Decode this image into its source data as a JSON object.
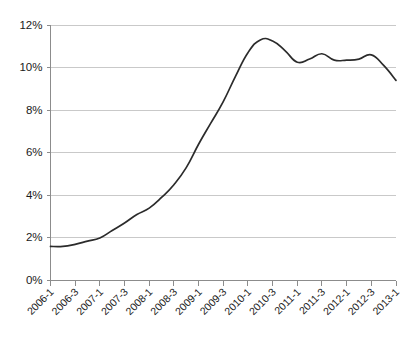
{
  "chart_data": {
    "type": "line",
    "title": "",
    "subtitle": "",
    "xlabel": "",
    "ylabel": "",
    "ylim": [
      0,
      12
    ],
    "yticks": [
      0,
      2,
      4,
      6,
      8,
      10,
      12
    ],
    "ytick_labels": [
      "0%",
      "2%",
      "4%",
      "6%",
      "8%",
      "10%",
      "12%"
    ],
    "grid": true,
    "legend": false,
    "legend_position": "none",
    "value_unit": "percent",
    "x_tick_labels": [
      "2006-1",
      "2006-3",
      "2007-1",
      "2007-3",
      "2008-1",
      "2008-3",
      "2009-1",
      "2009-3",
      "2010-1",
      "2010-3",
      "2011-1",
      "2011-3",
      "2012-1",
      "2012-3",
      "2013-1"
    ],
    "x": [
      "2006-1",
      "2006-2",
      "2006-3",
      "2006-4",
      "2007-1",
      "2007-2",
      "2007-3",
      "2007-4",
      "2008-1",
      "2008-2",
      "2008-3",
      "2008-4",
      "2009-1",
      "2009-2",
      "2009-3",
      "2009-4",
      "2010-1",
      "2010-2",
      "2010-3",
      "2010-4",
      "2011-1",
      "2011-2",
      "2011-3",
      "2011-4",
      "2012-1",
      "2012-2",
      "2012-3",
      "2012-4",
      "2013-1"
    ],
    "values": [
      1.6,
      1.6,
      1.7,
      1.85,
      2.0,
      2.35,
      2.7,
      3.1,
      3.4,
      3.9,
      4.5,
      5.3,
      6.4,
      7.4,
      8.4,
      9.6,
      10.7,
      11.3,
      11.25,
      10.8,
      10.25,
      10.4,
      10.65,
      10.35,
      10.35,
      10.4,
      10.6,
      10.1,
      9.4
    ],
    "series": [
      {
        "name": "Rate",
        "color": "#2b2b2b",
        "values": [
          1.6,
          1.6,
          1.7,
          1.85,
          2.0,
          2.35,
          2.7,
          3.1,
          3.4,
          3.9,
          4.5,
          5.3,
          6.4,
          7.4,
          8.4,
          9.6,
          10.7,
          11.3,
          11.25,
          10.8,
          10.25,
          10.4,
          10.65,
          10.35,
          10.35,
          10.4,
          10.6,
          10.1,
          9.4
        ]
      }
    ],
    "annotations": {
      "peak_label": "11.3",
      "peak_at": "2010-2",
      "start_label": "1.6",
      "end_label": "9.4"
    }
  },
  "colors": {
    "background": "#ffffff",
    "grid": "#c9c9c9",
    "axis": "#8c8c8c",
    "line": "#2b2b2b",
    "text": "#1a1a1a"
  }
}
